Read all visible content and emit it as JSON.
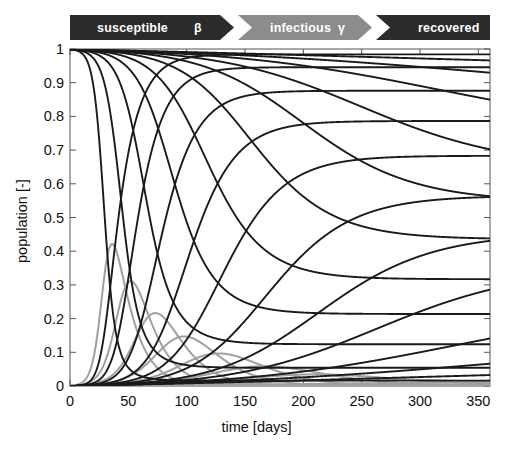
{
  "banner": {
    "segments": [
      {
        "label": "susceptible",
        "rate_symbol": "β",
        "color": "#2b2b2b",
        "text_color": "#ffffff"
      },
      {
        "label": "infectious",
        "rate_symbol": "γ",
        "color": "#8c8c8c",
        "text_color": "#ffffff"
      },
      {
        "label": "recovered",
        "rate_symbol": "",
        "color": "#2b2b2b",
        "text_color": "#ffffff"
      }
    ]
  },
  "chart_data": {
    "type": "line",
    "title": "",
    "xlabel": "time [days]",
    "ylabel": "population [-]",
    "xlim": [
      0,
      360
    ],
    "ylim": [
      0,
      1
    ],
    "xticks": [
      0,
      50,
      100,
      150,
      200,
      250,
      300,
      350
    ],
    "yticks": [
      0,
      0.1,
      0.2,
      0.3,
      0.4,
      0.5,
      0.6,
      0.7,
      0.8,
      0.9,
      1
    ],
    "grid": false,
    "legend": "none",
    "colors": {
      "susceptible": "#1a1a1a",
      "infectious": "#a0a0a0",
      "recovered": "#1a1a1a"
    },
    "model": "SIR",
    "parameters": {
      "gamma": 0.0714,
      "N": 1.0,
      "I0": 0.001,
      "beta_values": [
        0.3,
        0.22,
        0.17,
        0.14,
        0.12,
        0.105,
        0.095,
        0.088,
        0.082,
        0.0775,
        0.0735
      ],
      "R0_values": [
        4.2,
        3.08,
        2.38,
        1.96,
        1.68,
        1.47,
        1.33,
        1.23,
        1.15,
        1.085,
        1.03
      ]
    },
    "series": [
      {
        "name": "susceptible",
        "group": "S",
        "kind": "decay",
        "final_value": 0.012,
        "curve_index": 0
      },
      {
        "name": "susceptible",
        "group": "S",
        "kind": "decay",
        "final_value": 0.077,
        "curve_index": 1
      },
      {
        "name": "susceptible",
        "group": "S",
        "kind": "decay",
        "final_value": 0.14,
        "curve_index": 2
      },
      {
        "name": "susceptible",
        "group": "S",
        "kind": "decay",
        "final_value": 0.23,
        "curve_index": 3
      },
      {
        "name": "susceptible",
        "group": "S",
        "kind": "decay",
        "final_value": 0.32,
        "curve_index": 4
      },
      {
        "name": "susceptible",
        "group": "S",
        "kind": "decay",
        "final_value": 0.42,
        "curve_index": 5
      },
      {
        "name": "susceptible",
        "group": "S",
        "kind": "decay",
        "final_value": 0.52,
        "curve_index": 6
      },
      {
        "name": "susceptible",
        "group": "S",
        "kind": "decay",
        "final_value": 0.62,
        "curve_index": 7
      },
      {
        "name": "susceptible",
        "group": "S",
        "kind": "decay",
        "final_value": 0.7,
        "curve_index": 8
      },
      {
        "name": "susceptible",
        "group": "S",
        "kind": "decay",
        "final_value": 0.79,
        "curve_index": 9
      },
      {
        "name": "susceptible",
        "group": "S",
        "kind": "decay",
        "final_value": 0.88,
        "curve_index": 10
      },
      {
        "name": "recovered",
        "group": "R",
        "kind": "rise",
        "final_value": 0.988,
        "curve_index": 0
      },
      {
        "name": "recovered",
        "group": "R",
        "kind": "rise",
        "final_value": 0.923,
        "curve_index": 1
      },
      {
        "name": "recovered",
        "group": "R",
        "kind": "rise",
        "final_value": 0.86,
        "curve_index": 2
      },
      {
        "name": "recovered",
        "group": "R",
        "kind": "rise",
        "final_value": 0.77,
        "curve_index": 3
      },
      {
        "name": "recovered",
        "group": "R",
        "kind": "rise",
        "final_value": 0.68,
        "curve_index": 4
      },
      {
        "name": "recovered",
        "group": "R",
        "kind": "rise",
        "final_value": 0.58,
        "curve_index": 5
      },
      {
        "name": "recovered",
        "group": "R",
        "kind": "rise",
        "final_value": 0.48,
        "curve_index": 6
      },
      {
        "name": "recovered",
        "group": "R",
        "kind": "rise",
        "final_value": 0.38,
        "curve_index": 7
      },
      {
        "name": "recovered",
        "group": "R",
        "kind": "rise",
        "final_value": 0.3,
        "curve_index": 8
      },
      {
        "name": "recovered",
        "group": "R",
        "kind": "rise",
        "final_value": 0.21,
        "curve_index": 9
      },
      {
        "name": "recovered",
        "group": "R",
        "kind": "rise",
        "final_value": 0.12,
        "curve_index": 10
      },
      {
        "name": "infectious",
        "group": "I",
        "kind": "peak",
        "peak_value": 0.64,
        "peak_time": 13,
        "curve_index": 0
      },
      {
        "name": "infectious",
        "group": "I",
        "kind": "peak",
        "peak_value": 0.45,
        "peak_time": 22,
        "curve_index": 1
      },
      {
        "name": "infectious",
        "group": "I",
        "kind": "peak",
        "peak_value": 0.29,
        "peak_time": 34,
        "curve_index": 2
      },
      {
        "name": "infectious",
        "group": "I",
        "kind": "peak",
        "peak_value": 0.19,
        "peak_time": 48,
        "curve_index": 3
      },
      {
        "name": "infectious",
        "group": "I",
        "kind": "peak",
        "peak_value": 0.125,
        "peak_time": 64,
        "curve_index": 4
      },
      {
        "name": "infectious",
        "group": "I",
        "kind": "peak",
        "peak_value": 0.08,
        "peak_time": 83,
        "curve_index": 5
      },
      {
        "name": "infectious",
        "group": "I",
        "kind": "peak",
        "peak_value": 0.05,
        "peak_time": 105,
        "curve_index": 6
      },
      {
        "name": "infectious",
        "group": "I",
        "kind": "peak",
        "peak_value": 0.032,
        "peak_time": 130,
        "curve_index": 7
      },
      {
        "name": "infectious",
        "group": "I",
        "kind": "peak",
        "peak_value": 0.019,
        "peak_time": 160,
        "curve_index": 8
      },
      {
        "name": "infectious",
        "group": "I",
        "kind": "peak",
        "peak_value": 0.011,
        "peak_time": 195,
        "curve_index": 9
      },
      {
        "name": "infectious",
        "group": "I",
        "kind": "peak",
        "peak_value": 0.006,
        "peak_time": 235,
        "curve_index": 10
      }
    ]
  }
}
